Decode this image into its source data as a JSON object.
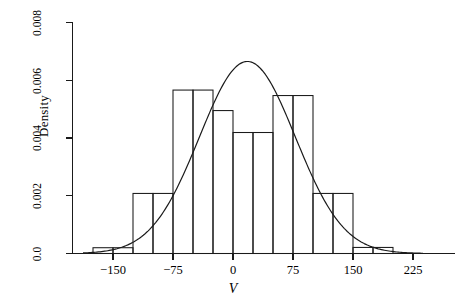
{
  "chart_data": {
    "type": "bar",
    "title": "",
    "subtitle": "",
    "xlabel": "V",
    "ylabel": "Density",
    "xlim": [
      -187.5,
      237.5
    ],
    "ylim": [
      0.0,
      0.008
    ],
    "grid": false,
    "legend": null,
    "bin_width": 25,
    "x_ticks": [
      -150,
      -75,
      0,
      75,
      150,
      225
    ],
    "x_tick_labels": [
      "−150",
      "−75",
      "0",
      "75",
      "150",
      "225"
    ],
    "y_ticks": [
      0.0,
      0.002,
      0.004,
      0.006,
      0.008
    ],
    "y_tick_labels": [
      "0.0",
      "0.002",
      "0.004",
      "0.006",
      "0.008"
    ],
    "bin_edges": [
      -175,
      -150,
      -125,
      -100,
      -75,
      -50,
      -25,
      0,
      25,
      50,
      75,
      100,
      125,
      150,
      175,
      200
    ],
    "values": [
      0.0002,
      0.0002,
      0.00208,
      0.00208,
      0.00566,
      0.00566,
      0.00495,
      0.00419,
      0.00419,
      0.00547,
      0.00547,
      0.00208,
      0.00208,
      0.00021,
      0.00021
    ],
    "series": [
      {
        "name": "Histogram",
        "type": "bar",
        "values": [
          0.0002,
          0.0002,
          0.00208,
          0.00208,
          0.00566,
          0.00566,
          0.00495,
          0.00419,
          0.00419,
          0.00547,
          0.00547,
          0.00208,
          0.00208,
          0.00021,
          0.00021
        ]
      },
      {
        "name": "Normal density curve",
        "type": "line",
        "mean": 18,
        "sd": 60,
        "peak": 0.00665,
        "x_start": -187.5,
        "x_end": 237.5
      }
    ],
    "colors": {
      "bar_stroke": "#1a1a1a",
      "bar_fill": "none",
      "curve": "#1a1a1a",
      "axis": "#1a1a1a",
      "background": "#ffffff"
    }
  },
  "axes": {
    "y_axis_name": "density-axis",
    "x_axis_name": "value-axis"
  }
}
